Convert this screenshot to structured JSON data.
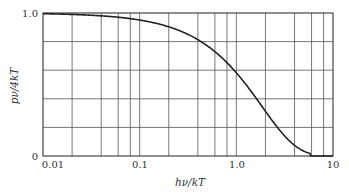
{
  "chart_data": {
    "type": "line",
    "title": "",
    "xlabel": "hν/kT",
    "ylabel": "pν/4kT",
    "xscale": "log",
    "xlim": [
      0.01,
      10
    ],
    "ylim": [
      0,
      1.0
    ],
    "grid": true,
    "legend": null,
    "x_tick_labels": [
      "0.01",
      "0.1",
      "1.0",
      "10"
    ],
    "y_tick_labels": [
      "0",
      "1.0"
    ],
    "x_minor_gridlines": [
      0.02,
      0.04,
      0.06,
      0.08,
      0.1,
      0.2,
      0.4,
      0.6,
      0.8,
      1.0,
      2,
      4,
      6,
      8
    ],
    "y_gridlines": [
      0.2,
      0.4,
      0.6,
      0.8
    ],
    "series": [
      {
        "name": "x/(e^x - 1)",
        "x": [
          0.01,
          0.02,
          0.04,
          0.06,
          0.08,
          0.1,
          0.2,
          0.4,
          0.6,
          0.8,
          1.0,
          1.5,
          2.0,
          3.0,
          4.0,
          5.0,
          6.0,
          8.0,
          10.0
        ],
        "y": [
          0.995,
          0.99,
          0.98,
          0.97,
          0.96,
          0.951,
          0.903,
          0.813,
          0.73,
          0.655,
          0.582,
          0.443,
          0.313,
          0.157,
          0.075,
          0.034,
          0.0,
          0.0,
          0.0
        ]
      }
    ]
  },
  "labels": {
    "x_axis": "hν/kT",
    "y_axis": "pν/4kT",
    "y_top": "1.0",
    "y_bottom": "0",
    "x0": "0.01",
    "x1": "0.1",
    "x2": "1.0",
    "x3": "10"
  }
}
